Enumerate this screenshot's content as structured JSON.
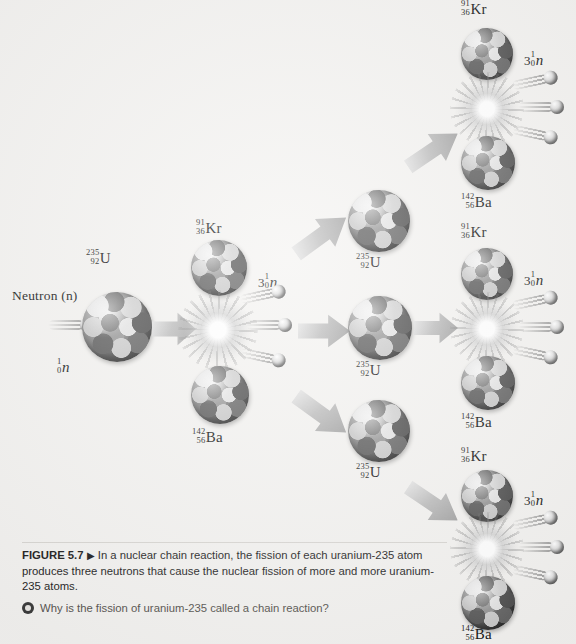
{
  "figure": {
    "number": "FIGURE 5.7",
    "triangle": "▶",
    "caption": "In a nuclear chain reaction, the fission of each uranium-235 atom produces three neutrons that cause the nuclear fission of more and more uranium-235 atoms.",
    "question": "Why is the fission of uranium-235 called a chain reaction?",
    "question_icon": "bullseye-icon"
  },
  "labels": {
    "neutron_word": "Neutron (n)",
    "neutron_symbol": {
      "mass": "1",
      "atomic": "0",
      "symbol": "n",
      "italic": true
    },
    "uranium": {
      "mass": "235",
      "atomic": "92",
      "symbol": "U"
    },
    "krypton": {
      "mass": "91",
      "atomic": "36",
      "symbol": "Kr"
    },
    "barium": {
      "mass": "142",
      "atomic": "56",
      "symbol": "Ba"
    },
    "three_neutrons": {
      "count": "3",
      "mass": "1",
      "atomic": "0",
      "symbol": "n",
      "italic": true
    }
  },
  "diagram": {
    "generations": 3,
    "neutrons_per_fission": 3,
    "incident_neutron": "1/0 n",
    "target_nucleus": "235/92 U",
    "products": [
      "91/36 Kr",
      "142/56 Ba"
    ],
    "gen1_uranium_count": 1,
    "gen2_uranium_count": 3,
    "gen3_fission_count": 3
  },
  "colors": {
    "background": "#f4f3f1",
    "nucleus_dark": "#3a3a3a",
    "nucleus_light": "#e8e8e8",
    "arrow_gray": "#bcbcbc",
    "text": "#131313",
    "question_text": "#55524e"
  }
}
